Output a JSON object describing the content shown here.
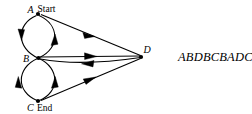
{
  "figure": {
    "type": "directed-graph-diagram",
    "background_color": "#ffffff",
    "stroke_color": "#000000"
  },
  "nodes": [
    {
      "id": "A",
      "label": "A",
      "annotation": "Start",
      "x": 38,
      "y": 14
    },
    {
      "id": "B",
      "label": "B",
      "annotation": "",
      "x": 38,
      "y": 58
    },
    {
      "id": "C",
      "label": "C",
      "annotation": "End",
      "x": 38,
      "y": 101
    },
    {
      "id": "D",
      "label": "D",
      "annotation": "",
      "x": 142,
      "y": 57
    }
  ],
  "edges": [
    {
      "id": "e1",
      "from": "B",
      "to": "A",
      "shape": "curve-left",
      "arrow": "up"
    },
    {
      "id": "e2",
      "from": "A",
      "to": "B",
      "shape": "curve-right",
      "arrow": "down"
    },
    {
      "id": "e3",
      "from": "B",
      "to": "C",
      "shape": "curve-left",
      "arrow": "down"
    },
    {
      "id": "e4",
      "from": "B",
      "to": "C",
      "shape": "curve-right",
      "arrow": "down"
    },
    {
      "id": "e5",
      "from": "A",
      "to": "D",
      "shape": "straight",
      "arrow": "right"
    },
    {
      "id": "e6",
      "from": "B",
      "to": "D",
      "shape": "straight",
      "arrow": "right"
    },
    {
      "id": "e7",
      "from": "D",
      "to": "B",
      "shape": "straight",
      "arrow": "left"
    },
    {
      "id": "e8",
      "from": "C",
      "to": "D",
      "shape": "straight",
      "arrow": "right"
    }
  ],
  "sequence": {
    "text": "ABDBCBADC"
  }
}
